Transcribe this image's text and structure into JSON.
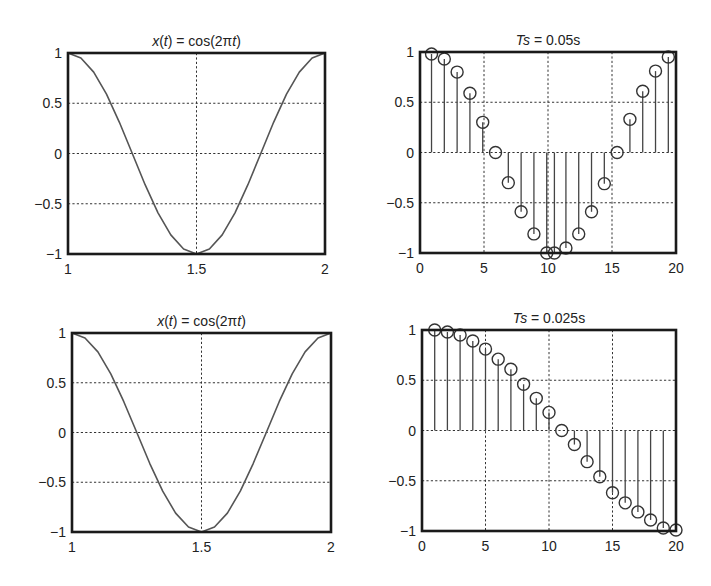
{
  "figure": {
    "width": 711,
    "height": 586,
    "background": "#ffffff",
    "ink": "#222222"
  },
  "chart_data": [
    {
      "id": "continuous-top",
      "type": "line",
      "title": "x(t) = cos(2πt)",
      "title_parts": [
        {
          "text": "x",
          "italic": true
        },
        {
          "text": "(",
          "italic": false
        },
        {
          "text": "t",
          "italic": true
        },
        {
          "text": ") = cos(2π",
          "italic": false
        },
        {
          "text": "t",
          "italic": true
        },
        {
          "text": ")",
          "italic": false
        }
      ],
      "xlabel": "",
      "ylabel": "",
      "xlim": [
        1,
        2
      ],
      "ylim": [
        -1,
        1
      ],
      "xticks": [
        1,
        1.5,
        2
      ],
      "xtick_labels": [
        "1",
        "1.5",
        "2"
      ],
      "yticks": [
        1,
        0.5,
        0,
        -0.5,
        -1
      ],
      "ytick_labels": [
        "1",
        "0.5",
        "0",
        "−0.5",
        "−1"
      ],
      "grid": true,
      "function": "cos(2*pi*t)",
      "x": [
        1.0,
        1.05,
        1.1,
        1.15,
        1.2,
        1.25,
        1.3,
        1.35,
        1.4,
        1.45,
        1.5,
        1.55,
        1.6,
        1.65,
        1.7,
        1.75,
        1.8,
        1.85,
        1.9,
        1.95,
        2.0
      ],
      "values": [
        1,
        0.95,
        0.81,
        0.59,
        0.31,
        0,
        -0.31,
        -0.59,
        -0.81,
        -0.95,
        -1,
        -0.95,
        -0.81,
        -0.59,
        -0.31,
        0,
        0.31,
        0.59,
        0.81,
        0.95,
        1
      ],
      "box": {
        "left": 68,
        "top": 53,
        "right": 325,
        "bottom": 254
      }
    },
    {
      "id": "sampled-top",
      "type": "stem",
      "title": "Ts = 0.05s",
      "title_parts": [
        {
          "text": "Ts",
          "italic": true
        },
        {
          "text": " = 0.05s",
          "italic": false
        }
      ],
      "xlabel": "",
      "ylabel": "",
      "xlim": [
        0,
        20
      ],
      "ylim": [
        -1,
        1
      ],
      "xticks": [
        0,
        5,
        10,
        15,
        20
      ],
      "xtick_labels": [
        "0",
        "5",
        "10",
        "15",
        "20"
      ],
      "yticks": [
        1,
        0.5,
        0,
        -0.5,
        -1
      ],
      "ytick_labels": [
        "1",
        "0.5",
        "0",
        "−0.5",
        "−1"
      ],
      "grid": true,
      "x": [
        0.9,
        1.9,
        2.9,
        3.9,
        4.9,
        5.9,
        6.9,
        7.9,
        8.9,
        9.9,
        10.5,
        11.4,
        12.4,
        13.4,
        14.4,
        15.4,
        16.4,
        17.4,
        18.4,
        19.4
      ],
      "values": [
        0.98,
        0.93,
        0.8,
        0.59,
        0.3,
        0.0,
        -0.3,
        -0.59,
        -0.81,
        -1.0,
        -1.0,
        -0.95,
        -0.81,
        -0.59,
        -0.31,
        0.0,
        0.33,
        0.61,
        0.81,
        0.95
      ],
      "box": {
        "left": 420,
        "top": 52,
        "right": 676,
        "bottom": 253
      }
    },
    {
      "id": "continuous-bottom",
      "type": "line",
      "title": "x(t) = cos(2πt)",
      "title_parts": [
        {
          "text": "x",
          "italic": true
        },
        {
          "text": "(",
          "italic": false
        },
        {
          "text": "t",
          "italic": true
        },
        {
          "text": ") = cos(2π",
          "italic": false
        },
        {
          "text": "t",
          "italic": true
        },
        {
          "text": ")",
          "italic": false
        }
      ],
      "xlabel": "",
      "ylabel": "",
      "xlim": [
        1,
        2
      ],
      "ylim": [
        -1,
        1
      ],
      "xticks": [
        1,
        1.5,
        2
      ],
      "xtick_labels": [
        "1",
        "1.5",
        "2"
      ],
      "yticks": [
        1,
        0.5,
        0,
        -0.5,
        -1
      ],
      "ytick_labels": [
        "1",
        "0.5",
        "0",
        "−0.5",
        "−1"
      ],
      "grid": true,
      "function": "cos(2*pi*t)",
      "x": [
        1.0,
        1.05,
        1.1,
        1.15,
        1.2,
        1.25,
        1.3,
        1.35,
        1.4,
        1.45,
        1.5,
        1.55,
        1.6,
        1.65,
        1.7,
        1.75,
        1.8,
        1.85,
        1.9,
        1.95,
        2.0
      ],
      "values": [
        1,
        0.95,
        0.81,
        0.59,
        0.31,
        0,
        -0.31,
        -0.59,
        -0.81,
        -0.95,
        -1,
        -0.95,
        -0.81,
        -0.59,
        -0.31,
        0,
        0.31,
        0.59,
        0.81,
        0.95,
        1
      ],
      "box": {
        "left": 72,
        "top": 333,
        "right": 331,
        "bottom": 532
      }
    },
    {
      "id": "sampled-bottom",
      "type": "stem",
      "title": "Ts = 0.025s",
      "title_parts": [
        {
          "text": "Ts",
          "italic": true
        },
        {
          "text": " = 0.025s",
          "italic": false
        }
      ],
      "xlabel": "",
      "ylabel": "",
      "xlim": [
        0,
        20
      ],
      "ylim": [
        -1,
        1
      ],
      "xticks": [
        0,
        5,
        10,
        15,
        20
      ],
      "xtick_labels": [
        "0",
        "5",
        "10",
        "15",
        "20"
      ],
      "yticks": [
        1,
        0.5,
        0,
        -0.5,
        -1
      ],
      "ytick_labels": [
        "1",
        "0.5",
        "0",
        "−0.5",
        "−1"
      ],
      "grid": true,
      "x": [
        1,
        2,
        3,
        4,
        5,
        6,
        7,
        8,
        9,
        10,
        11,
        12,
        13,
        14,
        15,
        16,
        17,
        18,
        19,
        20
      ],
      "values": [
        1.0,
        0.98,
        0.95,
        0.89,
        0.81,
        0.71,
        0.61,
        0.46,
        0.32,
        0.18,
        0.0,
        -0.14,
        -0.31,
        -0.46,
        -0.62,
        -0.72,
        -0.81,
        -0.89,
        -0.97,
        -0.99
      ],
      "box": {
        "left": 422,
        "top": 330,
        "right": 676,
        "bottom": 531
      }
    }
  ]
}
